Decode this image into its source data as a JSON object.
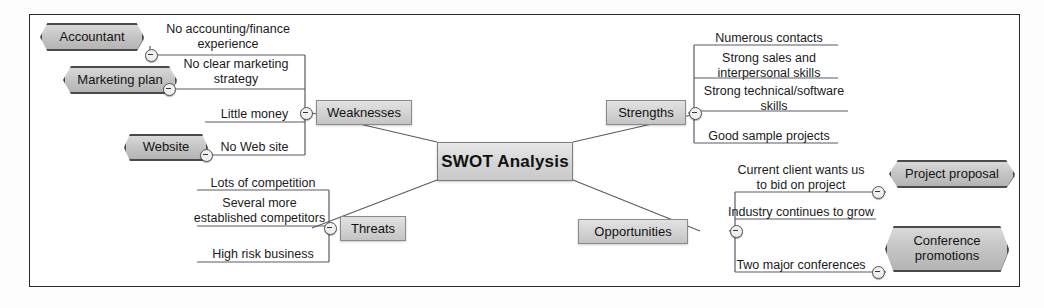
{
  "diagram": {
    "frame_color": "#2a2a2a",
    "node_fill": "#d2d2d2",
    "line_color": "#5a5a6a"
  },
  "central": {
    "label": "SWOT Analysis"
  },
  "branches": {
    "weaknesses": {
      "label": "Weaknesses"
    },
    "strengths": {
      "label": "Strengths"
    },
    "threats": {
      "label": "Threats"
    },
    "opportunities": {
      "label": "Opportunities"
    }
  },
  "weaknesses_items": [
    {
      "label": "No accounting/finance\nexperience"
    },
    {
      "label": "No clear marketing\nstrategy"
    },
    {
      "label": "Little money"
    },
    {
      "label": "No Web site"
    }
  ],
  "strengths_items": [
    {
      "label": "Numerous contacts"
    },
    {
      "label": "Strong sales and\ninterpersonal skills"
    },
    {
      "label": "Strong technical/software\nskills"
    },
    {
      "label": "Good sample projects"
    }
  ],
  "threats_items": [
    {
      "label": "Lots of competition"
    },
    {
      "label": "Several more\nestablished competitors"
    },
    {
      "label": "High risk business"
    }
  ],
  "opportunities_items": [
    {
      "label": "Current client wants us\nto bid on project"
    },
    {
      "label": "Industry continues to grow"
    },
    {
      "label": "Two major conferences"
    }
  ],
  "callouts": [
    {
      "label": "Accountant"
    },
    {
      "label": "Marketing plan"
    },
    {
      "label": "Website"
    },
    {
      "label": "Project proposal"
    },
    {
      "label": "Conference\npromotions"
    }
  ],
  "toggles": {
    "icon": "collapse-minus-icon",
    "count": 9
  }
}
